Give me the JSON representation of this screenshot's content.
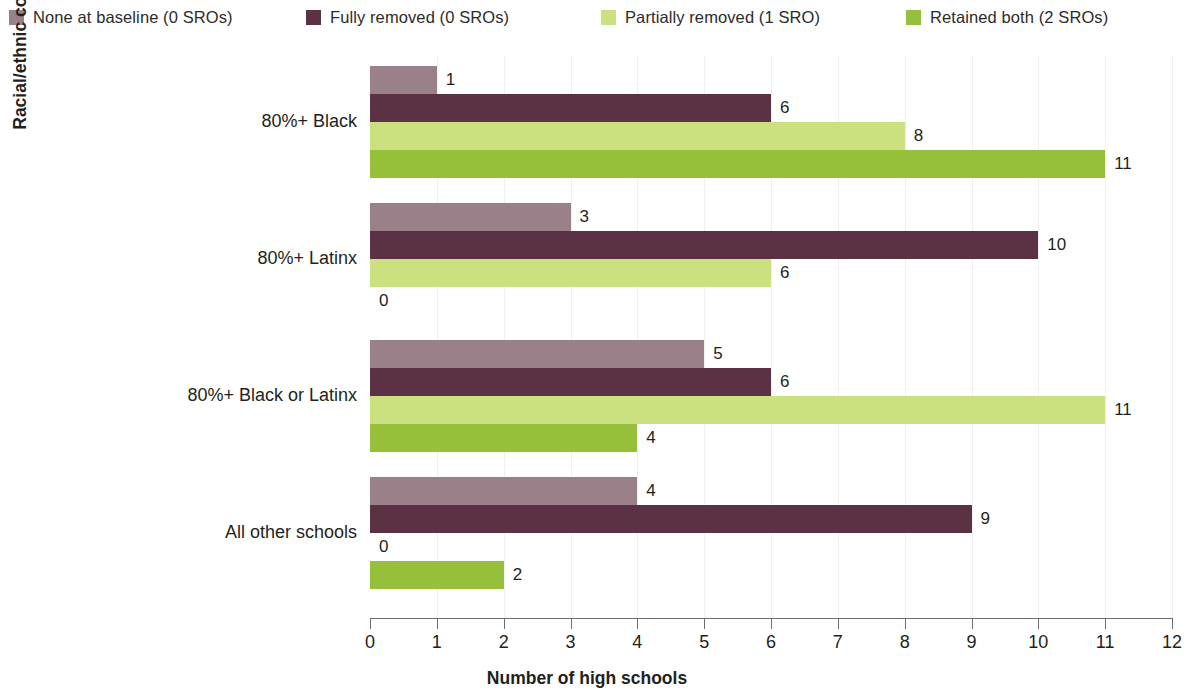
{
  "chart_data": {
    "type": "bar",
    "orientation": "horizontal",
    "title": "",
    "xlabel": "Number of high schools",
    "ylabel": "Racial/ethnic composition of school",
    "xlim": [
      0,
      12
    ],
    "xticks": [
      0,
      1,
      2,
      3,
      4,
      5,
      6,
      7,
      8,
      9,
      10,
      11,
      12
    ],
    "xticklabels": [
      "0",
      "1",
      "2",
      "3",
      "4",
      "5",
      "6",
      "7",
      "8",
      "9",
      "10",
      "11",
      "12"
    ],
    "grid": "vertical-faint",
    "legend_position": "top",
    "categories": [
      "80%+ Black",
      "80%+ Latinx",
      "80%+ Black or Latinx",
      "All other schools"
    ],
    "series": [
      {
        "name": "None at baseline (0 SROs)",
        "color": "#9a8088",
        "values": [
          1,
          3,
          5,
          4
        ],
        "value_labels": [
          "1",
          "3",
          "5",
          "4"
        ]
      },
      {
        "name": "Fully removed (0 SROs)",
        "color": "#5a3244",
        "values": [
          6,
          10,
          6,
          9
        ],
        "value_labels": [
          "6",
          "10",
          "6",
          "9"
        ]
      },
      {
        "name": "Partially removed (1 SRO)",
        "color": "#cbe07f",
        "values": [
          8,
          6,
          11,
          0
        ],
        "value_labels": [
          "8",
          "6",
          "11",
          "0"
        ]
      },
      {
        "name": "Retained both (2 SROs)",
        "color": "#96bf3a",
        "values": [
          11,
          0,
          4,
          2
        ],
        "value_labels": [
          "11",
          "0",
          "4",
          "2"
        ]
      }
    ]
  },
  "legend": {
    "items": [
      {
        "label": "None at baseline (0 SROs)",
        "color": "#9a8088"
      },
      {
        "label": "Fully removed (0 SROs)",
        "color": "#5a3244"
      },
      {
        "label": "Partially removed (1 SRO)",
        "color": "#cbe07f"
      },
      {
        "label": "Retained both (2 SROs)",
        "color": "#96bf3a"
      }
    ]
  },
  "axes": {
    "x_title": "Number of high schools",
    "y_title": "Racial/ethnic composition of school"
  }
}
